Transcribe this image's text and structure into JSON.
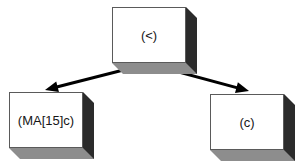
{
  "diagram": {
    "background_color": "#ffffff",
    "node_face_color": "#ffffff",
    "node_side_color": "#2b2b2b",
    "node_bottom_color": "#8d8d8d",
    "node_border_color": "#5a5a5a",
    "edge_color": "#000000",
    "nodes": [
      {
        "id": "root",
        "label": "(<)",
        "name": "node-root",
        "x": 112,
        "y": 7,
        "w": 74,
        "h": 56,
        "depth": 11
      },
      {
        "id": "left-child",
        "label": "(MA[15]c)",
        "name": "node-left-child",
        "x": 9,
        "y": 92,
        "w": 74,
        "h": 56,
        "depth": 11
      },
      {
        "id": "right-child",
        "label": "(c)",
        "name": "node-right-child",
        "x": 210,
        "y": 94,
        "w": 74,
        "h": 56,
        "depth": 11
      }
    ],
    "edges": [
      {
        "id": "root-to-left",
        "name": "edge-root-to-left-child",
        "from": "root",
        "to": "left-child",
        "x1": 147,
        "y1": 64,
        "x2": 45,
        "y2": 90,
        "arrowhead": "triangle",
        "width": 3
      },
      {
        "id": "root-to-right",
        "name": "edge-root-to-right-child",
        "from": "root",
        "to": "right-child",
        "x1": 149,
        "y1": 64,
        "x2": 249,
        "y2": 91,
        "arrowhead": "triangle",
        "width": 3
      }
    ]
  }
}
